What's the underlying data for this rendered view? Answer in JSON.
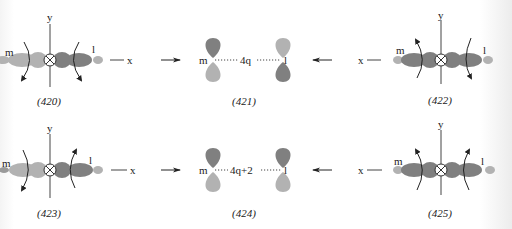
{
  "figure": {
    "colors": {
      "dark_lobe": "#7a7a7a",
      "light_lobe": "#b2b2b2",
      "line": "#333333",
      "text": "#222222"
    },
    "rows": [
      {
        "panels": [
          {
            "id": "420",
            "caption": "(420)",
            "axis_x_label": "x",
            "axis_y_label": "y",
            "end_labels": {
              "left": "m",
              "right": "l"
            },
            "rotation_left": "clockwise-down",
            "rotation_right": "counterclockwise-down"
          },
          {
            "id": "421",
            "caption": "(421)",
            "left_label": "m",
            "right_label": "l",
            "bridge_label": "4q"
          },
          {
            "id": "422",
            "caption": "(422)",
            "axis_x_label": "x",
            "axis_y_label": "y",
            "end_labels": {
              "left": "m",
              "right": "l"
            },
            "rotation_left": "up",
            "rotation_right": "down"
          }
        ],
        "arrow_right": "→",
        "arrow_left": "←"
      },
      {
        "panels": [
          {
            "id": "423",
            "caption": "(423)",
            "axis_x_label": "x",
            "axis_y_label": "y",
            "end_labels": {
              "left": "m",
              "right": "l"
            },
            "rotation_left": "down",
            "rotation_right": "up"
          },
          {
            "id": "424",
            "caption": "(424)",
            "left_label": "m",
            "right_label": "l",
            "bridge_label": "4q+2"
          },
          {
            "id": "425",
            "caption": "(425)",
            "axis_x_label": "x",
            "axis_y_label": "y",
            "end_labels": {
              "left": "m",
              "right": "l"
            },
            "rotation_left": "up",
            "rotation_right": "up"
          }
        ],
        "arrow_right": "→",
        "arrow_left": "←"
      }
    ]
  }
}
